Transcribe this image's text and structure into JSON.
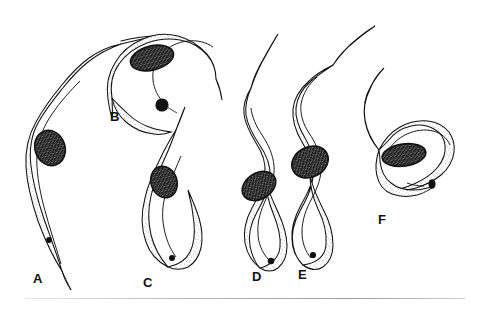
{
  "figure": {
    "kind": "scientific-line-drawing",
    "background_color": "#ffffff",
    "ink_color": "#111111",
    "cytoplasm_fill": "#fdfdfd",
    "nucleus_fill": "#1a1a1a",
    "stipple_color": "#4a4a4a",
    "panel_count": 6,
    "rule": {
      "visible": true,
      "color": "#9d9d9d"
    }
  },
  "panels": [
    {
      "id": "a",
      "label": "A",
      "label_x": 33,
      "label_y": 272,
      "orientation": "vertical-slender",
      "description": "long slender trypomastigote with very long free flagellum arcing upward",
      "has_nucleus": true,
      "has_kinetoplast": true,
      "kinetoplast_size": "small",
      "undulating_membrane": true
    },
    {
      "id": "b",
      "label": "B",
      "label_x": 110,
      "label_y": 110,
      "orientation": "diagonal-broad",
      "description": "broad curved form with very large round kinetoplast at blunt posterior",
      "has_nucleus": true,
      "has_kinetoplast": true,
      "kinetoplast_size": "large",
      "undulating_membrane": true
    },
    {
      "id": "c",
      "label": "C",
      "label_x": 143,
      "label_y": 276,
      "orientation": "vertical-curved",
      "description": "short stumpy form with tapering anterior flagellum",
      "has_nucleus": true,
      "has_kinetoplast": true,
      "kinetoplast_size": "small",
      "undulating_membrane": true
    },
    {
      "id": "d",
      "label": "D",
      "label_x": 252,
      "label_y": 270,
      "orientation": "vertical-sinuous",
      "description": "sinuous form with central dark nucleus and rounded posterior",
      "has_nucleus": true,
      "has_kinetoplast": true,
      "kinetoplast_size": "small",
      "undulating_membrane": true
    },
    {
      "id": "e",
      "label": "E",
      "label_x": 298,
      "label_y": 268,
      "orientation": "vertical-sinuous",
      "description": "sinuous form with large oval nucleus and prominent undulating membrane",
      "has_nucleus": true,
      "has_kinetoplast": true,
      "kinetoplast_size": "small",
      "undulating_membrane": true
    },
    {
      "id": "f",
      "label": "F",
      "label_x": 378,
      "label_y": 213,
      "orientation": "horizontal-hooked",
      "description": "hooked broad form lying sideways with elongate nucleus and oval kinetoplast",
      "has_nucleus": true,
      "has_kinetoplast": true,
      "kinetoplast_size": "medium-oval",
      "undulating_membrane": true
    }
  ]
}
